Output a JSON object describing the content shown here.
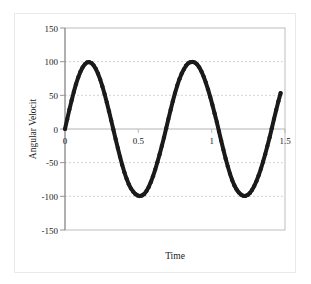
{
  "chart_data": {
    "type": "line",
    "title": "",
    "subtitle": "",
    "xlabel": "Time",
    "ylabel": "Angular Velocit",
    "xlim": [
      0,
      1.5
    ],
    "ylim": [
      -150,
      150
    ],
    "xticks": [
      0,
      0.5,
      1,
      1.5
    ],
    "xtick_labels": [
      "0",
      "0.5",
      "1",
      "1.5"
    ],
    "yticks": [
      150,
      100,
      50,
      0,
      -50,
      -100,
      -150
    ],
    "ytick_labels": [
      "150",
      "100",
      "50",
      "0",
      "-50",
      "-100",
      "-150"
    ],
    "grid": {
      "horizontal": true,
      "vertical": false,
      "style": "dashed",
      "color": "#c8c8c8"
    },
    "legend": {
      "visible": false,
      "position": "none",
      "entries": []
    },
    "annotations": [],
    "series": [
      {
        "name": "Angular Velocity",
        "color": "#1a1a1a",
        "marker": "dot",
        "line_width": 4,
        "description": "Dense black marker trace forming a sinusoid of amplitude ~100 deg/s, period ~0.645 s, starting at 0 and rising, ending near t=1.5 on the descent after the third peak.",
        "amplitude": 100,
        "period": 0.645,
        "phase": 0,
        "x": [
          0.0,
          0.015,
          0.03,
          0.045,
          0.06,
          0.075,
          0.09,
          0.105,
          0.12,
          0.135,
          0.15,
          0.165,
          0.18,
          0.195,
          0.21,
          0.225,
          0.24,
          0.255,
          0.27,
          0.285,
          0.3,
          0.315,
          0.33,
          0.345,
          0.36,
          0.375,
          0.39,
          0.405,
          0.42,
          0.435,
          0.45,
          0.465,
          0.48,
          0.495,
          0.51,
          0.525,
          0.54,
          0.555,
          0.57,
          0.585,
          0.6,
          0.615,
          0.63,
          0.645,
          0.66,
          0.675,
          0.69,
          0.705,
          0.72,
          0.735,
          0.75,
          0.765,
          0.78,
          0.795,
          0.81,
          0.825,
          0.84,
          0.855,
          0.87,
          0.885,
          0.9,
          0.915,
          0.93,
          0.945,
          0.96,
          0.975,
          0.99,
          1.005,
          1.02,
          1.035,
          1.05,
          1.065,
          1.08,
          1.095,
          1.11,
          1.125,
          1.14,
          1.155,
          1.17,
          1.185,
          1.2,
          1.215,
          1.23,
          1.245,
          1.26,
          1.275,
          1.29,
          1.305,
          1.32,
          1.335,
          1.35,
          1.365,
          1.38,
          1.395,
          1.41,
          1.425,
          1.44,
          1.455,
          1.47
        ],
        "y": [
          0.0,
          14.6,
          28.8,
          42.4,
          55.1,
          66.6,
          76.6,
          85.0,
          91.5,
          96.1,
          98.8,
          99.4,
          98.0,
          94.6,
          89.3,
          82.2,
          73.5,
          63.3,
          51.9,
          39.5,
          26.4,
          12.8,
          -1.0,
          -14.8,
          -28.3,
          -41.2,
          -53.3,
          -64.3,
          -74.0,
          -82.1,
          -88.5,
          -93.1,
          -96.6,
          -98.7,
          -99.6,
          -98.7,
          -96.6,
          -92.3,
          -86.4,
          -79.0,
          -70.2,
          -60.3,
          -49.4,
          -37.7,
          -25.4,
          -12.8,
          1.0,
          14.8,
          28.3,
          41.2,
          53.3,
          64.3,
          74.0,
          82.1,
          88.5,
          94.1,
          97.6,
          99.3,
          99.6,
          98.7,
          96.1,
          91.7,
          85.6,
          78.0,
          69.0,
          58.9,
          47.7,
          35.8,
          23.2,
          10.3,
          -3.6,
          -17.4,
          -30.9,
          -43.7,
          -55.7,
          -66.5,
          -76.0,
          -83.8,
          -89.9,
          -94.3,
          -97.5,
          -99.2,
          -99.4,
          -98.0,
          -95.1,
          -90.7,
          -84.8,
          -77.6,
          -69.1,
          -59.5,
          -48.9,
          -37.5,
          -25.4,
          -12.8,
          1.0,
          14.8,
          28.3,
          41.2,
          53.3
        ]
      }
    ]
  },
  "axes": {
    "yaxis_title": "Angular Velocit",
    "xaxis_title": "Time"
  }
}
